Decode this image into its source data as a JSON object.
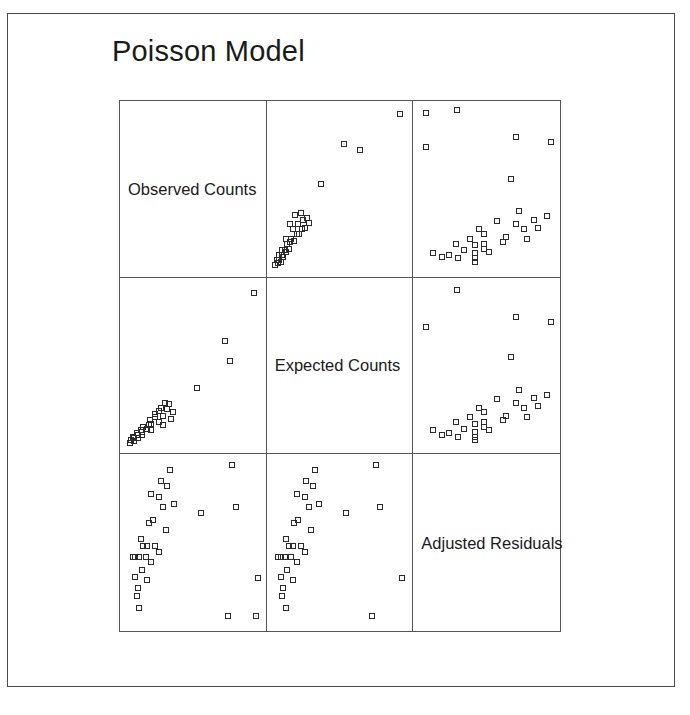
{
  "figure": {
    "title": "Poisson Model",
    "frame_color": "#4a4a4a",
    "grid_color": "#555555",
    "marker_color": "#2b2b2b",
    "background": "#ffffff"
  },
  "chart_data": {
    "type": "scatter",
    "title": "Poisson Model",
    "matrix": true,
    "grid": false,
    "legend": "none",
    "variables": [
      "Observed Counts",
      "Expected Counts",
      "Adjusted Residuals"
    ],
    "xlabel": "",
    "ylabel": "",
    "note": "3x3 scatterplot matrix; diagonal cells carry variable names, off-diagonal cells are pairwise scatterplots with open square markers",
    "xlim": [
      0,
      1
    ],
    "ylim": [
      0,
      1
    ],
    "panels": [
      {
        "row": 0,
        "col": 0,
        "kind": "diagonal",
        "label": "Observed Counts",
        "x": "Observed Counts",
        "y": "Observed Counts",
        "points": []
      },
      {
        "row": 0,
        "col": 1,
        "kind": "scatter",
        "x": "Expected Counts",
        "y": "Observed Counts",
        "points": [
          [
            0.02,
            0.03
          ],
          [
            0.04,
            0.04
          ],
          [
            0.03,
            0.06
          ],
          [
            0.05,
            0.06
          ],
          [
            0.06,
            0.05
          ],
          [
            0.05,
            0.09
          ],
          [
            0.07,
            0.09
          ],
          [
            0.08,
            0.08
          ],
          [
            0.07,
            0.12
          ],
          [
            0.09,
            0.12
          ],
          [
            0.1,
            0.11
          ],
          [
            0.12,
            0.13
          ],
          [
            0.11,
            0.16
          ],
          [
            0.13,
            0.17
          ],
          [
            0.1,
            0.19
          ],
          [
            0.14,
            0.19
          ],
          [
            0.16,
            0.18
          ],
          [
            0.18,
            0.22
          ],
          [
            0.2,
            0.22
          ],
          [
            0.15,
            0.25
          ],
          [
            0.22,
            0.25
          ],
          [
            0.13,
            0.28
          ],
          [
            0.19,
            0.28
          ],
          [
            0.24,
            0.26
          ],
          [
            0.23,
            0.31
          ],
          [
            0.26,
            0.32
          ],
          [
            0.21,
            0.35
          ],
          [
            0.17,
            0.34
          ],
          [
            0.27,
            0.29
          ],
          [
            0.36,
            0.53
          ],
          [
            0.53,
            0.78
          ],
          [
            0.65,
            0.74
          ],
          [
            0.95,
            0.96
          ]
        ]
      },
      {
        "row": 0,
        "col": 2,
        "kind": "scatter",
        "x": "Adjusted Residuals",
        "y": "Observed Counts",
        "points": [
          [
            0.1,
            0.1
          ],
          [
            0.17,
            0.08
          ],
          [
            0.22,
            0.09
          ],
          [
            0.27,
            0.16
          ],
          [
            0.29,
            0.07
          ],
          [
            0.33,
            0.12
          ],
          [
            0.38,
            0.19
          ],
          [
            0.41,
            0.15
          ],
          [
            0.41,
            0.1
          ],
          [
            0.41,
            0.05
          ],
          [
            0.41,
            0.07
          ],
          [
            0.44,
            0.25
          ],
          [
            0.48,
            0.22
          ],
          [
            0.48,
            0.16
          ],
          [
            0.48,
            0.13
          ],
          [
            0.52,
            0.11
          ],
          [
            0.58,
            0.3
          ],
          [
            0.62,
            0.17
          ],
          [
            0.64,
            0.2
          ],
          [
            0.72,
            0.28
          ],
          [
            0.74,
            0.36
          ],
          [
            0.78,
            0.25
          ],
          [
            0.8,
            0.19
          ],
          [
            0.85,
            0.31
          ],
          [
            0.88,
            0.26
          ],
          [
            0.95,
            0.33
          ],
          [
            0.05,
            0.97
          ],
          [
            0.05,
            0.76
          ],
          [
            0.28,
            0.99
          ],
          [
            0.68,
            0.56
          ],
          [
            0.72,
            0.82
          ],
          [
            0.98,
            0.79
          ]
        ]
      },
      {
        "row": 1,
        "col": 0,
        "kind": "scatter",
        "x": "Observed Counts",
        "y": "Expected Counts",
        "points": [
          [
            0.03,
            0.02
          ],
          [
            0.04,
            0.04
          ],
          [
            0.06,
            0.03
          ],
          [
            0.06,
            0.05
          ],
          [
            0.05,
            0.06
          ],
          [
            0.09,
            0.05
          ],
          [
            0.09,
            0.07
          ],
          [
            0.08,
            0.08
          ],
          [
            0.12,
            0.07
          ],
          [
            0.12,
            0.09
          ],
          [
            0.11,
            0.1
          ],
          [
            0.13,
            0.12
          ],
          [
            0.16,
            0.11
          ],
          [
            0.17,
            0.13
          ],
          [
            0.19,
            0.1
          ],
          [
            0.19,
            0.14
          ],
          [
            0.18,
            0.16
          ],
          [
            0.22,
            0.18
          ],
          [
            0.22,
            0.2
          ],
          [
            0.25,
            0.15
          ],
          [
            0.25,
            0.22
          ],
          [
            0.28,
            0.13
          ],
          [
            0.28,
            0.19
          ],
          [
            0.26,
            0.24
          ],
          [
            0.31,
            0.23
          ],
          [
            0.32,
            0.26
          ],
          [
            0.35,
            0.21
          ],
          [
            0.34,
            0.17
          ],
          [
            0.29,
            0.27
          ],
          [
            0.53,
            0.36
          ],
          [
            0.78,
            0.53
          ],
          [
            0.74,
            0.65
          ],
          [
            0.96,
            0.95
          ]
        ]
      },
      {
        "row": 1,
        "col": 1,
        "kind": "diagonal",
        "label": "Expected Counts",
        "x": "Expected Counts",
        "y": "Expected Counts",
        "points": []
      },
      {
        "row": 1,
        "col": 2,
        "kind": "scatter",
        "x": "Adjusted Residuals",
        "y": "Expected Counts",
        "points": [
          [
            0.1,
            0.1
          ],
          [
            0.17,
            0.07
          ],
          [
            0.22,
            0.08
          ],
          [
            0.27,
            0.15
          ],
          [
            0.29,
            0.06
          ],
          [
            0.33,
            0.11
          ],
          [
            0.38,
            0.18
          ],
          [
            0.41,
            0.14
          ],
          [
            0.41,
            0.09
          ],
          [
            0.41,
            0.04
          ],
          [
            0.41,
            0.06
          ],
          [
            0.44,
            0.24
          ],
          [
            0.48,
            0.21
          ],
          [
            0.48,
            0.15
          ],
          [
            0.48,
            0.12
          ],
          [
            0.52,
            0.1
          ],
          [
            0.58,
            0.29
          ],
          [
            0.62,
            0.16
          ],
          [
            0.64,
            0.19
          ],
          [
            0.72,
            0.27
          ],
          [
            0.74,
            0.35
          ],
          [
            0.78,
            0.24
          ],
          [
            0.8,
            0.18
          ],
          [
            0.85,
            0.3
          ],
          [
            0.88,
            0.25
          ],
          [
            0.95,
            0.32
          ],
          [
            0.05,
            0.74
          ],
          [
            0.28,
            0.97
          ],
          [
            0.68,
            0.55
          ],
          [
            0.72,
            0.8
          ],
          [
            0.98,
            0.77
          ]
        ]
      },
      {
        "row": 2,
        "col": 0,
        "kind": "scatter",
        "x": "Observed Counts",
        "y": "Adjusted Residuals",
        "points": [
          [
            0.1,
            0.1
          ],
          [
            0.08,
            0.17
          ],
          [
            0.09,
            0.22
          ],
          [
            0.16,
            0.27
          ],
          [
            0.07,
            0.29
          ],
          [
            0.12,
            0.33
          ],
          [
            0.19,
            0.38
          ],
          [
            0.15,
            0.41
          ],
          [
            0.1,
            0.41
          ],
          [
            0.05,
            0.41
          ],
          [
            0.07,
            0.41
          ],
          [
            0.25,
            0.44
          ],
          [
            0.22,
            0.48
          ],
          [
            0.16,
            0.48
          ],
          [
            0.13,
            0.48
          ],
          [
            0.11,
            0.52
          ],
          [
            0.3,
            0.58
          ],
          [
            0.17,
            0.62
          ],
          [
            0.2,
            0.64
          ],
          [
            0.28,
            0.72
          ],
          [
            0.36,
            0.74
          ],
          [
            0.25,
            0.78
          ],
          [
            0.19,
            0.8
          ],
          [
            0.31,
            0.85
          ],
          [
            0.26,
            0.88
          ],
          [
            0.33,
            0.95
          ],
          [
            0.97,
            0.05
          ],
          [
            0.76,
            0.05
          ],
          [
            0.99,
            0.28
          ],
          [
            0.56,
            0.68
          ],
          [
            0.82,
            0.72
          ],
          [
            0.79,
            0.98
          ]
        ]
      },
      {
        "row": 2,
        "col": 1,
        "kind": "scatter",
        "x": "Expected Counts",
        "y": "Adjusted Residuals",
        "points": [
          [
            0.1,
            0.1
          ],
          [
            0.07,
            0.17
          ],
          [
            0.08,
            0.22
          ],
          [
            0.15,
            0.27
          ],
          [
            0.06,
            0.29
          ],
          [
            0.11,
            0.33
          ],
          [
            0.18,
            0.38
          ],
          [
            0.14,
            0.41
          ],
          [
            0.09,
            0.41
          ],
          [
            0.04,
            0.41
          ],
          [
            0.06,
            0.41
          ],
          [
            0.24,
            0.44
          ],
          [
            0.21,
            0.48
          ],
          [
            0.15,
            0.48
          ],
          [
            0.12,
            0.48
          ],
          [
            0.1,
            0.52
          ],
          [
            0.29,
            0.58
          ],
          [
            0.16,
            0.62
          ],
          [
            0.19,
            0.64
          ],
          [
            0.27,
            0.72
          ],
          [
            0.35,
            0.74
          ],
          [
            0.24,
            0.78
          ],
          [
            0.18,
            0.8
          ],
          [
            0.3,
            0.85
          ],
          [
            0.25,
            0.88
          ],
          [
            0.32,
            0.95
          ],
          [
            0.74,
            0.05
          ],
          [
            0.97,
            0.28
          ],
          [
            0.55,
            0.68
          ],
          [
            0.8,
            0.72
          ],
          [
            0.77,
            0.98
          ]
        ]
      },
      {
        "row": 2,
        "col": 2,
        "kind": "diagonal",
        "label": "Adjusted Residuals",
        "x": "Adjusted Residuals",
        "y": "Adjusted Residuals",
        "points": []
      }
    ]
  }
}
